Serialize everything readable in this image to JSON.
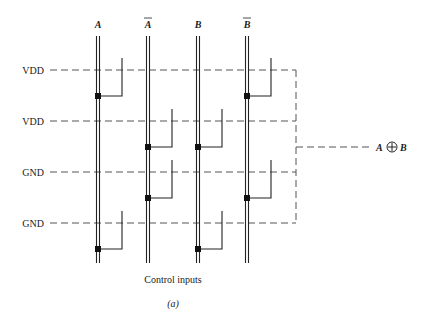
{
  "diagram": {
    "rails": [
      {
        "label": "A",
        "overbar": false,
        "x": 98
      },
      {
        "label": "A",
        "overbar": true,
        "x": 148
      },
      {
        "label": "B",
        "overbar": false,
        "x": 198
      },
      {
        "label": "B",
        "overbar": true,
        "x": 247
      }
    ],
    "supply_lines": [
      {
        "label": "VDD",
        "y": 70
      },
      {
        "label": "VDD",
        "y": 121
      },
      {
        "label": "GND",
        "y": 172
      },
      {
        "label": "GND",
        "y": 223
      }
    ],
    "switches": [
      {
        "row": 0,
        "rail": "A",
        "dot_y": 96
      },
      {
        "row": 0,
        "rail": "B-bar",
        "dot_y": 96
      },
      {
        "row": 1,
        "rail": "A-bar",
        "dot_y": 147
      },
      {
        "row": 1,
        "rail": "B",
        "dot_y": 147
      },
      {
        "row": 2,
        "rail": "A-bar",
        "dot_y": 198
      },
      {
        "row": 2,
        "rail": "B-bar",
        "dot_y": 198
      },
      {
        "row": 3,
        "rail": "A",
        "dot_y": 249
      },
      {
        "row": 3,
        "rail": "B",
        "dot_y": 249
      }
    ],
    "output": {
      "left_operand": "A",
      "operator_symbol": "⊕",
      "right_operand": "B",
      "full_label": "A ⊕ B"
    },
    "caption": "Control inputs",
    "subfigure_label": "(a)",
    "colors": {
      "line": "#222222",
      "dashed": "#555555",
      "background": "#ffffff"
    }
  }
}
